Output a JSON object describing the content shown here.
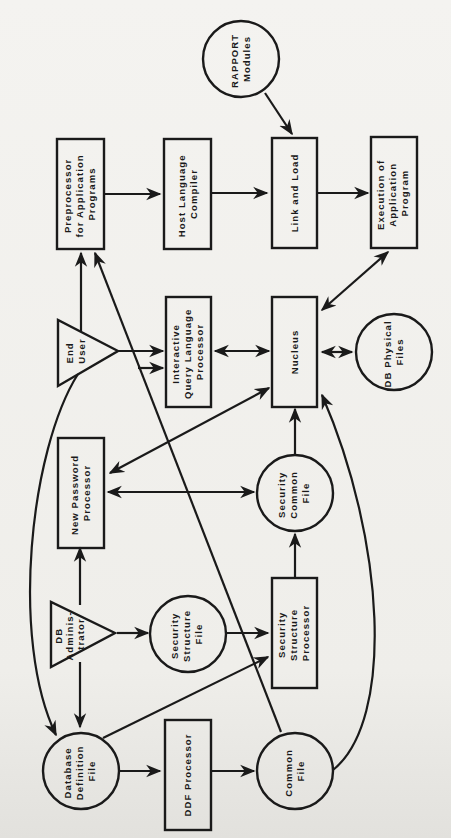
{
  "diagram": {
    "orientation": "rotated 90° counter-clockwise",
    "nodes": {
      "preprocessor": {
        "shape": "rectangle",
        "lines": [
          "Preprocessor",
          "for Application",
          "Programs"
        ]
      },
      "host_compiler": {
        "shape": "rectangle",
        "lines": [
          "Host Language",
          "Compiler"
        ]
      },
      "link_load": {
        "shape": "rectangle",
        "lines": [
          "Link and Load"
        ]
      },
      "execution": {
        "shape": "rectangle",
        "lines": [
          "Execution of",
          "Application",
          "Program"
        ]
      },
      "rapport_modules": {
        "shape": "circle",
        "lines": [
          "RAPPORT",
          "Modules"
        ]
      },
      "end_user": {
        "shape": "triangle",
        "lines": [
          "End",
          "User"
        ]
      },
      "iqlp": {
        "shape": "rectangle",
        "lines": [
          "Interactive",
          "Query Language",
          "Processor"
        ]
      },
      "nucleus": {
        "shape": "rectangle",
        "lines": [
          "Nucleus"
        ]
      },
      "db_physical": {
        "shape": "circle",
        "lines": [
          "DB Physical",
          "Files"
        ]
      },
      "new_password": {
        "shape": "rectangle",
        "lines": [
          "New Password",
          "Processor"
        ]
      },
      "security_common": {
        "shape": "circle",
        "lines": [
          "Security",
          "Common",
          "File"
        ]
      },
      "db_admin": {
        "shape": "triangle",
        "lines": [
          "DB",
          "Adminis-",
          "trator"
        ]
      },
      "security_structure_file": {
        "shape": "circle",
        "lines": [
          "Security",
          "Structure",
          "File"
        ]
      },
      "security_structure_processor": {
        "shape": "rectangle",
        "lines": [
          "Security",
          "Structure",
          "Processor"
        ]
      },
      "db_definition_file": {
        "shape": "circle",
        "lines": [
          "Database",
          "Definition",
          "File"
        ]
      },
      "ddf_processor": {
        "shape": "rectangle",
        "lines": [
          "DDF Processor"
        ]
      },
      "common_file": {
        "shape": "circle",
        "lines": [
          "Common",
          "File"
        ]
      }
    },
    "edges": [
      {
        "from": "Preprocessor for Application Programs",
        "to": "Host Language Compiler"
      },
      {
        "from": "Host Language Compiler",
        "to": "Link and Load"
      },
      {
        "from": "Link and Load",
        "to": "Execution of Application Program"
      },
      {
        "from": "RAPPORT Modules",
        "to": "Link and Load"
      },
      {
        "from": "End User",
        "to": "Preprocessor for Application Programs"
      },
      {
        "from": "End User",
        "to": "Interactive Query Language Processor",
        "count": 2
      },
      {
        "from": "End User",
        "to": "Database Definition File"
      },
      {
        "from": "Interactive Query Language Processor",
        "to": "Nucleus",
        "bidirectional": true
      },
      {
        "from": "Nucleus",
        "to": "DB Physical Files",
        "bidirectional": true
      },
      {
        "from": "Nucleus",
        "to": "Execution of Application Program",
        "bidirectional": true
      },
      {
        "from": "Nucleus",
        "to": "New Password Processor",
        "bidirectional": true
      },
      {
        "from": "New Password Processor",
        "to": "Security Common File",
        "bidirectional": true
      },
      {
        "from": "Security Common File",
        "to": "Nucleus"
      },
      {
        "from": "DB Administrator",
        "to": "New Password Processor"
      },
      {
        "from": "DB Administrator",
        "to": "Security Structure File"
      },
      {
        "from": "DB Administrator",
        "to": "Database Definition File"
      },
      {
        "from": "Security Structure File",
        "to": "Security Structure Processor"
      },
      {
        "from": "Security Structure Processor",
        "to": "Security Common File"
      },
      {
        "from": "Database Definition File",
        "to": "Security Structure Processor"
      },
      {
        "from": "Database Definition File",
        "to": "DDF Processor"
      },
      {
        "from": "DDF Processor",
        "to": "Common File"
      },
      {
        "from": "Common File",
        "to": "Preprocessor for Application Programs"
      },
      {
        "from": "Common File",
        "to": "Nucleus"
      }
    ]
  }
}
